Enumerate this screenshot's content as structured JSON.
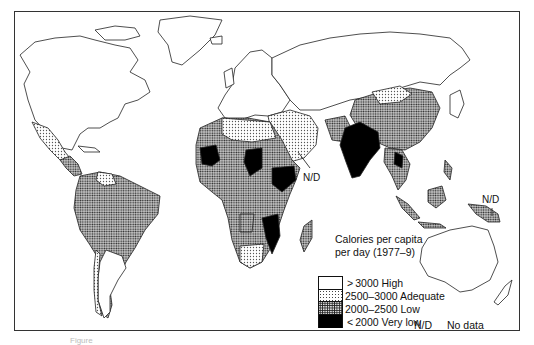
{
  "map": {
    "title_line1": "Calories per capita",
    "title_line2": "per day (1977–9)",
    "legend": [
      {
        "range": "> 3000",
        "label": "High",
        "text": "> 3000  High",
        "pattern": "white"
      },
      {
        "range": "2500–3000",
        "label": "Adequate",
        "text": "2500–3000  Adequate",
        "pattern": "light-dots"
      },
      {
        "range": "2000–2500",
        "label": "Low",
        "text": "2000–2500  Low",
        "pattern": "dense-dots"
      },
      {
        "range": "< 2000",
        "label": "Very low",
        "text": "< 2000  Very low",
        "pattern": "black"
      }
    ],
    "no_data": {
      "abbr": "N/D",
      "label": "No data"
    },
    "annotations": [
      {
        "text": "N/D",
        "location": "Arabian peninsula / Gulf"
      },
      {
        "text": "N/D",
        "location": "New Guinea"
      }
    ],
    "colors": {
      "high": "#ffffff",
      "adequate": "#e6e6e6",
      "low": "#9a9a9a",
      "very_low": "#000000",
      "outline": "#222222"
    },
    "caption": "Figure"
  }
}
